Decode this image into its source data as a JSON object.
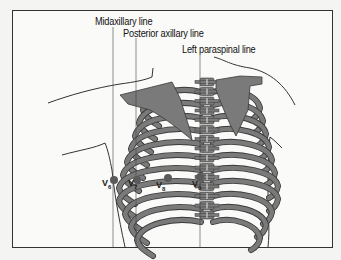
{
  "diagram": {
    "reference_lines": [
      {
        "id": "midaxillary",
        "label": "Midaxillary line"
      },
      {
        "id": "posterior-axillary",
        "label": "Posterior axillary line"
      },
      {
        "id": "left-paraspinal",
        "label": "Left paraspinal  line"
      }
    ],
    "leads": [
      {
        "id": "v6",
        "label": "V",
        "sub": "6"
      },
      {
        "id": "v7",
        "label": "V",
        "sub": "7"
      },
      {
        "id": "v8",
        "label": "V",
        "sub": "8"
      },
      {
        "id": "v9",
        "label": "V",
        "sub": "9"
      }
    ],
    "colors": {
      "bone": "#7a7a7a",
      "bone_outline": "#3a3a3a",
      "electrode": "#5a5a5a",
      "background": "#f4f4f2",
      "frame": "#333333"
    }
  }
}
